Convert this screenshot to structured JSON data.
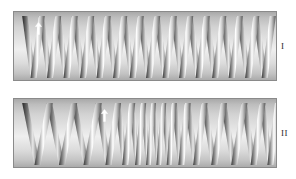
{
  "figure": {
    "title": "",
    "background_color": "#ffffff",
    "panels": [
      {
        "id": "panel-1",
        "label": "I",
        "description": "coil spring with uniform pitch",
        "border_color": "#8a8a8a",
        "coil_count": 15,
        "pitch_type": "uniform",
        "marker": {
          "name": "arrow-marker",
          "x_pct": 9,
          "y_pct": 14,
          "direction": "up"
        },
        "coil_x_positions": [
          2,
          8.4,
          14.8,
          21.2,
          27.6,
          34,
          40.4,
          46.8,
          53.2,
          59.6,
          66,
          72.4,
          78.8,
          85.2,
          91.6,
          98
        ]
      },
      {
        "id": "panel-2",
        "label": "II",
        "description": "coil spring with variable pitch, compressed at centre",
        "border_color": "#8a8a8a",
        "coil_count": 15,
        "pitch_type": "variable",
        "marker": {
          "name": "arrow-marker",
          "x_pct": 34,
          "y_pct": 14,
          "direction": "up"
        },
        "coil_x_positions": [
          2,
          11.5,
          21,
          30.5,
          38,
          43.5,
          48,
          52,
          56,
          60,
          65,
          71.5,
          79,
          87,
          94,
          100
        ]
      }
    ]
  },
  "chart_data": {
    "type": "diagram",
    "series": [
      {
        "name": "I",
        "pitch": "uniform",
        "values": [
          6.4,
          6.4,
          6.4,
          6.4,
          6.4,
          6.4,
          6.4,
          6.4,
          6.4,
          6.4,
          6.4,
          6.4,
          6.4,
          6.4,
          6.4
        ]
      },
      {
        "name": "II",
        "pitch": "variable",
        "values": [
          9.5,
          9.5,
          9.5,
          7.5,
          5.5,
          4.5,
          4,
          4,
          4,
          5,
          6.5,
          7.5,
          8,
          7,
          6
        ]
      }
    ],
    "legend": [
      "I",
      "II"
    ],
    "xlabel": "",
    "ylabel": ""
  }
}
